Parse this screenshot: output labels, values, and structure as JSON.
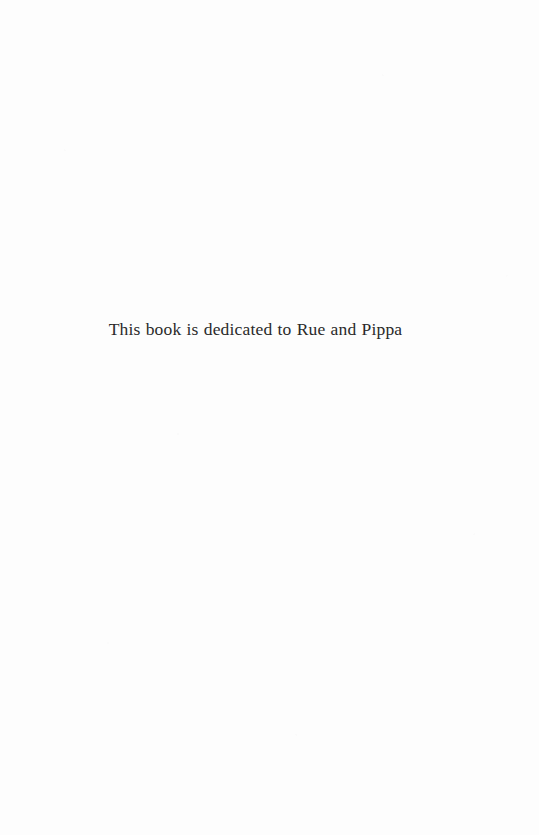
{
  "page": {
    "kind": "book-dedication-page",
    "background_color": "#fdfdfd",
    "width": 539,
    "height": 835
  },
  "dedication": {
    "text": "This book is dedicated to Rue and Pippa",
    "text_color": "#2a2a2a",
    "alignment": "center"
  }
}
